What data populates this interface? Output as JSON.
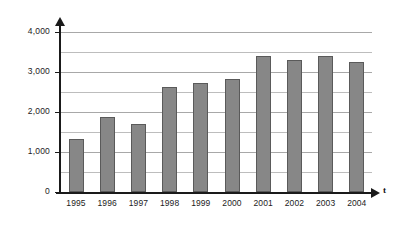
{
  "chart_data": {
    "type": "bar",
    "title": "",
    "xlabel": "t",
    "ylabel": "",
    "categories": [
      "1995",
      "1996",
      "1997",
      "1998",
      "1999",
      "2000",
      "2001",
      "2002",
      "2003",
      "2004"
    ],
    "values": [
      1330,
      1870,
      1690,
      2620,
      2720,
      2820,
      3400,
      3300,
      3400,
      3250
    ],
    "ylim": [
      0,
      4000
    ],
    "y_ticks_major": [
      "0",
      "1,000",
      "2,000",
      "3,000",
      "4,000"
    ],
    "y_tick_values_major": [
      0,
      1000,
      2000,
      3000,
      4000
    ],
    "y_tick_values_minor": [
      500,
      1500,
      2500,
      3500
    ],
    "grid": true,
    "grid_step": 500,
    "legend": "none",
    "bar_color": "#878787",
    "bar_border_color": "#5a5a5a",
    "axis_color": "#1a1a1a",
    "gridline_color": "#a8a8a8",
    "background_color": "#ffffff"
  },
  "axes": {
    "x_axis_arrow_label": "t"
  }
}
